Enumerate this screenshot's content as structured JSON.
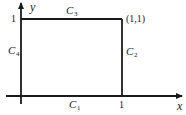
{
  "diagram": {
    "axes": {
      "x_label": "x",
      "y_label": "y",
      "x_tick": "1",
      "y_tick": "1"
    },
    "corner_label": "(1,1)",
    "sides": [
      {
        "id": "C1",
        "name": "C",
        "sub": "1",
        "position": "bottom"
      },
      {
        "id": "C2",
        "name": "C",
        "sub": "2",
        "position": "right"
      },
      {
        "id": "C3",
        "name": "C",
        "sub": "3",
        "position": "top"
      },
      {
        "id": "C4",
        "name": "C",
        "sub": "4",
        "position": "left"
      }
    ],
    "colors": {
      "line": "#1a1a1a",
      "background": "#ffffff"
    }
  }
}
